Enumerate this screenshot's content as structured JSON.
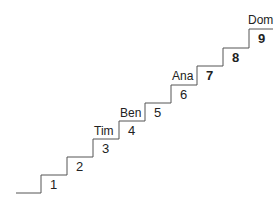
{
  "diagram": {
    "type": "staircase",
    "line_color": "#555555",
    "steps": [
      {
        "number": "1",
        "name": "",
        "bold": false
      },
      {
        "number": "2",
        "name": "",
        "bold": false
      },
      {
        "number": "3",
        "name": "",
        "bold": false
      },
      {
        "number": "4",
        "name": "Tim",
        "bold": false
      },
      {
        "number": "5",
        "name": "Ben",
        "bold": false
      },
      {
        "number": "6",
        "name": "",
        "bold": false
      },
      {
        "number": "7",
        "name": "Ana",
        "bold": true
      },
      {
        "number": "8",
        "name": "",
        "bold": true
      },
      {
        "number": "9",
        "name": "Dom",
        "bold": true
      }
    ]
  }
}
